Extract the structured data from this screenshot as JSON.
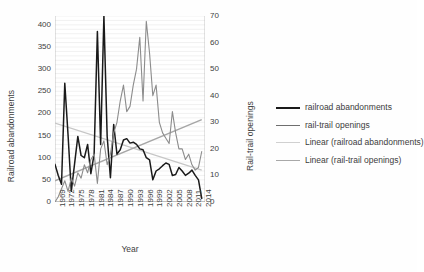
{
  "chart_data": {
    "type": "line",
    "title": "",
    "xlabel": "Year",
    "ylabel_left": "Railroad abandonments",
    "ylabel_right": "Rail-trail openings",
    "xlim": [
      1969,
      2015
    ],
    "ylim_left": [
      0,
      420
    ],
    "ylim_right": [
      0,
      70
    ],
    "y_left_ticks": [
      0,
      50,
      100,
      150,
      200,
      250,
      300,
      350,
      400
    ],
    "y_right_ticks": [
      0,
      10,
      20,
      30,
      40,
      50,
      60,
      70
    ],
    "x_ticks": [
      1969,
      1972,
      1975,
      1978,
      1981,
      1984,
      1987,
      1990,
      1993,
      1996,
      1999,
      2002,
      2005,
      2008,
      2011,
      2014
    ],
    "grid": "horizontal-minor",
    "legend_position": "right",
    "x": [
      1969,
      1970,
      1971,
      1972,
      1973,
      1974,
      1975,
      1976,
      1977,
      1978,
      1979,
      1980,
      1981,
      1982,
      1983,
      1984,
      1985,
      1986,
      1987,
      1988,
      1989,
      1990,
      1991,
      1992,
      1993,
      1994,
      1995,
      1996,
      1997,
      1998,
      1999,
      2000,
      2001,
      2002,
      2003,
      2004,
      2005,
      2006,
      2007,
      2008,
      2009,
      2010,
      2011,
      2012,
      2013,
      2014
    ],
    "series": [
      {
        "name": "railroad abandonments",
        "axis": "left",
        "color": "#1a1a1a",
        "width": 1.5,
        "values": [
          85,
          60,
          40,
          268,
          152,
          24,
          86,
          148,
          105,
          100,
          130,
          64,
          108,
          385,
          130,
          420,
          148,
          55,
          175,
          108,
          118,
          140,
          143,
          133,
          135,
          130,
          120,
          118,
          100,
          95,
          50,
          70,
          75,
          82,
          88,
          85,
          60,
          62,
          78,
          70,
          60,
          65,
          72,
          60,
          50,
          8
        ]
      },
      {
        "name": "rail-trail openings",
        "axis": "right",
        "color": "#8c8c8c",
        "width": 1.1,
        "values": [
          0,
          2,
          5,
          8,
          4,
          9,
          6,
          11,
          9,
          14,
          11,
          16,
          18,
          7,
          20,
          23,
          14,
          18,
          26,
          30,
          38,
          44,
          34,
          36,
          44,
          50,
          62,
          38,
          68,
          56,
          40,
          44,
          30,
          26,
          24,
          22,
          34,
          26,
          20,
          20,
          16,
          18,
          14,
          12,
          13,
          19
        ]
      }
    ],
    "trendlines": [
      {
        "name": "Linear (railroad abandonments)",
        "axis": "left",
        "color": "#c6c6c6",
        "width": 1.2,
        "start_value": 178,
        "end_value": 72
      },
      {
        "name": "Linear (rail-trail openings)",
        "axis": "right",
        "color": "#a6a6a6",
        "width": 1.4,
        "start_value": 8,
        "end_value": 31
      }
    ],
    "legend": [
      {
        "label": "railroad abandonments",
        "color": "#1a1a1a",
        "width": 2.2
      },
      {
        "label": "rail-trail openings",
        "color": "#6e6e6e",
        "width": 1.3
      },
      {
        "label": "Linear (railroad abandonments)",
        "color": "#d0d0d0",
        "width": 1.3
      },
      {
        "label": "Linear (rail-trail openings)",
        "color": "#a8a8a8",
        "width": 1.6
      }
    ]
  }
}
